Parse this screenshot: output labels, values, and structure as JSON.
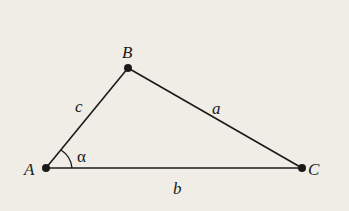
{
  "diagram": {
    "type": "triangle",
    "colors": {
      "background": "#efede6",
      "stroke": "#1a1a1a"
    },
    "vertices": [
      {
        "id": "A",
        "label": "A",
        "x": 46,
        "y": 168
      },
      {
        "id": "B",
        "label": "B",
        "x": 128,
        "y": 68
      },
      {
        "id": "C",
        "label": "C",
        "x": 302,
        "y": 168
      }
    ],
    "sides": [
      {
        "id": "a",
        "label": "a",
        "from": "B",
        "to": "C"
      },
      {
        "id": "b",
        "label": "b",
        "from": "A",
        "to": "C"
      },
      {
        "id": "c",
        "label": "c",
        "from": "A",
        "to": "B"
      }
    ],
    "angles": [
      {
        "id": "alpha",
        "label": "α",
        "vertex": "A"
      }
    ]
  }
}
